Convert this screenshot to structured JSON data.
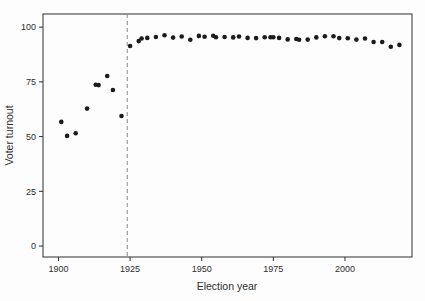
{
  "figure": {
    "background": "#fdfdfd",
    "point_color": "#1b1b1b",
    "axis_color": "#2e2e2e",
    "text_color": "#2e2e2e",
    "dashed_line_color": "#8a8a8a"
  },
  "chart_data": {
    "type": "scatter",
    "title": "",
    "xlabel": "Election year",
    "ylabel": "Voter turnout",
    "xlim": [
      1894.6,
      2023.4
    ],
    "ylim": [
      -5,
      106
    ],
    "x_ticks": [
      1900,
      1925,
      1950,
      1975,
      2000
    ],
    "y_ticks": [
      0,
      25,
      50,
      75,
      100
    ],
    "grid": false,
    "legend": false,
    "frame_box": true,
    "vline": {
      "x": 1924,
      "style": "dashed"
    },
    "points": [
      {
        "year": 1901,
        "turnout": 56.7
      },
      {
        "year": 1903,
        "turnout": 50.3
      },
      {
        "year": 1906,
        "turnout": 51.5
      },
      {
        "year": 1910,
        "turnout": 62.8
      },
      {
        "year": 1913,
        "turnout": 73.7
      },
      {
        "year": 1914,
        "turnout": 73.5
      },
      {
        "year": 1917,
        "turnout": 77.7
      },
      {
        "year": 1919,
        "turnout": 71.3
      },
      {
        "year": 1922,
        "turnout": 59.4
      },
      {
        "year": 1925,
        "turnout": 91.4
      },
      {
        "year": 1928,
        "turnout": 93.6
      },
      {
        "year": 1929,
        "turnout": 94.8
      },
      {
        "year": 1931,
        "turnout": 95.1
      },
      {
        "year": 1934,
        "turnout": 95.5
      },
      {
        "year": 1937,
        "turnout": 96.3
      },
      {
        "year": 1940,
        "turnout": 95.2
      },
      {
        "year": 1943,
        "turnout": 95.7
      },
      {
        "year": 1946,
        "turnout": 94.2
      },
      {
        "year": 1949,
        "turnout": 96.0
      },
      {
        "year": 1951,
        "turnout": 95.6
      },
      {
        "year": 1954,
        "turnout": 96.1
      },
      {
        "year": 1955,
        "turnout": 95.4
      },
      {
        "year": 1958,
        "turnout": 95.5
      },
      {
        "year": 1961,
        "turnout": 95.3
      },
      {
        "year": 1963,
        "turnout": 95.7
      },
      {
        "year": 1966,
        "turnout": 95.1
      },
      {
        "year": 1969,
        "turnout": 95.0
      },
      {
        "year": 1972,
        "turnout": 95.4
      },
      {
        "year": 1974,
        "turnout": 95.4
      },
      {
        "year": 1975,
        "turnout": 95.4
      },
      {
        "year": 1977,
        "turnout": 95.1
      },
      {
        "year": 1980,
        "turnout": 94.4
      },
      {
        "year": 1983,
        "turnout": 94.6
      },
      {
        "year": 1984,
        "turnout": 94.2
      },
      {
        "year": 1987,
        "turnout": 94.3
      },
      {
        "year": 1990,
        "turnout": 95.3
      },
      {
        "year": 1993,
        "turnout": 95.8
      },
      {
        "year": 1996,
        "turnout": 95.8
      },
      {
        "year": 1998,
        "turnout": 95.0
      },
      {
        "year": 2001,
        "turnout": 94.9
      },
      {
        "year": 2004,
        "turnout": 94.3
      },
      {
        "year": 2007,
        "turnout": 94.8
      },
      {
        "year": 2010,
        "turnout": 93.2
      },
      {
        "year": 2013,
        "turnout": 93.2
      },
      {
        "year": 2016,
        "turnout": 91.0
      },
      {
        "year": 2019,
        "turnout": 91.9
      }
    ]
  }
}
